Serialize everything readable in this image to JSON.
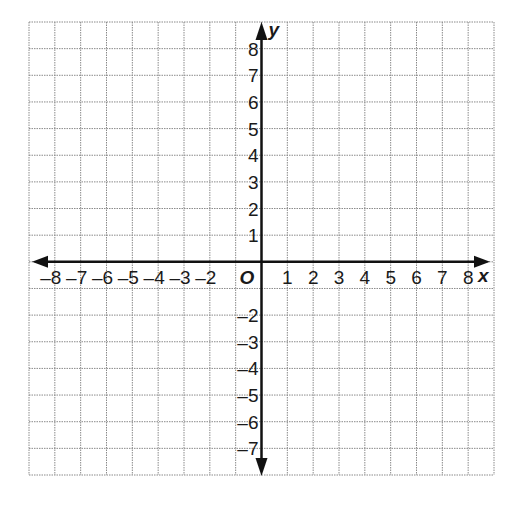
{
  "diagram": {
    "type": "coordinate-plane",
    "grid": {
      "left": 29,
      "right": 494,
      "top": 22,
      "bottom": 475,
      "x_min": -9,
      "x_max": 9,
      "y_min": -8,
      "y_max": 9,
      "line_color": "#8a8a8a",
      "line_style": "dotted"
    },
    "axes": {
      "color": "#111111",
      "x_label": "x",
      "y_label": "y",
      "origin_label": "O",
      "x_ticks": [
        -8,
        -7,
        -6,
        -5,
        -4,
        -3,
        -2,
        1,
        2,
        3,
        4,
        5,
        6,
        7,
        8
      ],
      "y_ticks": [
        8,
        7,
        6,
        5,
        4,
        3,
        2,
        1,
        -2,
        -3,
        -4,
        -5,
        -6,
        -7
      ]
    }
  }
}
